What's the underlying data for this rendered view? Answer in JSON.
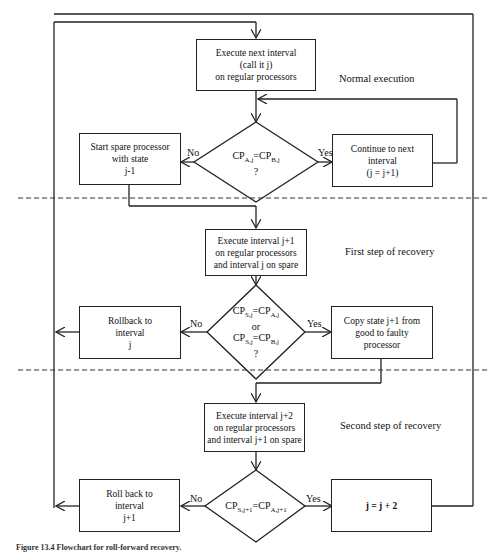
{
  "diagram": {
    "type": "flowchart",
    "sections": [
      {
        "label": "Normal execution"
      },
      {
        "label": "First step of recovery"
      },
      {
        "label": "Second step of recovery"
      }
    ],
    "boxes": {
      "exec_next": [
        "Execute next interval",
        "(call it j)",
        "on regular processors"
      ],
      "start_spare": [
        "Start spare processor",
        "with state",
        "j-1"
      ],
      "continue_next": [
        "Continue to next",
        "interval",
        "(j = j+1)"
      ],
      "exec_j1": [
        "Execute interval j+1",
        "on regular processors",
        "and interval j on spare"
      ],
      "rollback_j": [
        "Rollback to",
        "interval",
        "j"
      ],
      "copy_state": [
        "Copy state j+1 from",
        "good to faulty",
        "processor"
      ],
      "exec_j2": [
        "Execute interval j+2",
        "on regular processors",
        "and interval j+1 on spare"
      ],
      "rollback_j1": [
        "Roll back to",
        "interval",
        "j+1"
      ],
      "j_plus_2": [
        "j = j + 2"
      ]
    },
    "decisions": {
      "d1": {
        "lhs": "CP",
        "lhs_sub": "A,j",
        "eq": "=",
        "rhs": "CP",
        "rhs_sub": "B,j",
        "q": "?"
      },
      "d2": {
        "l1_lhs": "CP",
        "l1_lhs_sub": "S,j",
        "l1_rhs": "CP",
        "l1_rhs_sub": "A,j",
        "or": "or",
        "l2_lhs": "CP",
        "l2_lhs_sub": "S,j",
        "l2_rhs": "CP",
        "l2_rhs_sub": "B,j",
        "eq": "=",
        "q": "?"
      },
      "d3": {
        "lhs": "CP",
        "lhs_sub": "S,j+1",
        "eq": "=",
        "rhs": "CP",
        "rhs_sub": "A,j+1"
      }
    },
    "branch_labels": {
      "no": "No",
      "yes": "Yes"
    },
    "caption": "Figure 13.4 Flowchart for roll-forward recovery."
  }
}
